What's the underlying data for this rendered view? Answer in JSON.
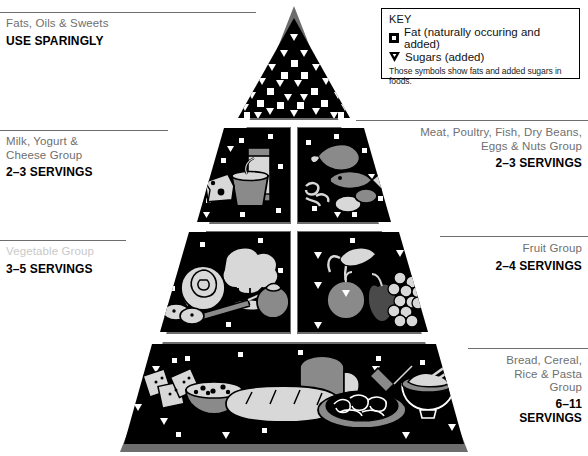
{
  "key": {
    "heading": "KEY",
    "fat_label": "Fat (naturally occuring and added)",
    "fat_icon": "filled-square-with-white-center-icon",
    "sugar_label": "Sugars (added)",
    "sugar_icon": "down-triangle-icon",
    "note": "Those symbols show fats and added sugars in foods."
  },
  "colors": {
    "pyramid_face": "#000000",
    "pyramid_bevel": "#6d6d6d",
    "food_light": "#d8d8d8",
    "food_mid": "#8a8a8a",
    "background": "#ffffff",
    "group_text": "#6f6f6f",
    "servings_text": "#000000",
    "faded_text": "#c9c9c9"
  },
  "tiers": [
    {
      "id": "apex",
      "group": "Fats, Oils & Sweets",
      "servings": "USE SPARINGLY",
      "side": "left",
      "faded": false
    },
    {
      "id": "milk",
      "group": "Milk, Yogurt &\nCheese Group",
      "group_line1": "Milk, Yogurt &",
      "group_line2": "Cheese Group",
      "servings": "2–3 SERVINGS",
      "side": "left",
      "faded": false
    },
    {
      "id": "meat",
      "group_line1": "Meat, Poultry, Fish, Dry Beans,",
      "group_line2": "Eggs & Nuts Group",
      "servings": "2–3 SERVINGS",
      "side": "right",
      "faded": false
    },
    {
      "id": "vegetable",
      "group_line1": "Vegetable Group",
      "servings": "3–5 SERVINGS",
      "side": "left",
      "faded": true
    },
    {
      "id": "fruit",
      "group_line1": "Fruit Group",
      "servings": "2–4 SERVINGS",
      "side": "right",
      "faded": false
    },
    {
      "id": "bread",
      "group_line1": "Bread, Cereal,",
      "group_line2": "Rice & Pasta",
      "group_line3": "Group",
      "servings_line1": "6–11",
      "servings_line2": "SERVINGS",
      "side": "right",
      "faded": false
    }
  ],
  "panels": {
    "apex_icon": "sugar-and-fat-symbols-icon",
    "milk_icon": "cheese-milk-yogurt-icon",
    "meat_icon": "poultry-fish-beans-eggs-icon",
    "vegetable_icon": "lettuce-broccoli-carrot-tomato-icon",
    "fruit_icon": "banana-peach-apple-grapes-icon",
    "bread_icon": "crackers-cereal-bread-pasta-rice-icon"
  }
}
